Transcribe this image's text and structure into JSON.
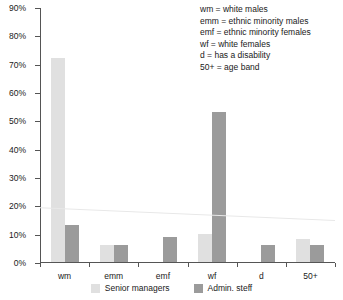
{
  "chart_data": {
    "type": "bar",
    "title": "",
    "xlabel": "",
    "ylabel": "",
    "ylim": [
      0,
      90
    ],
    "ytick_labels": [
      "0%",
      "10%",
      "20%",
      "30%",
      "40%",
      "50%",
      "60%",
      "70%",
      "80%",
      "90%"
    ],
    "ytick_values": [
      0,
      10,
      20,
      30,
      40,
      50,
      60,
      70,
      80,
      90
    ],
    "grid": false,
    "legend_position": "bottom",
    "categories": [
      "wm",
      "emm",
      "emf",
      "wf",
      "d",
      "50+"
    ],
    "series": [
      {
        "name": "Senior managers",
        "color": "#e0e0e0",
        "values": [
          72,
          6,
          null,
          10,
          null,
          8
        ]
      },
      {
        "name": "Admin. steff",
        "color": "#9b9b9b",
        "values": [
          13,
          6,
          9,
          53,
          6,
          6
        ]
      }
    ],
    "trendline": {
      "name": "trend",
      "color": "#e8e8e8",
      "start_value": 19.5,
      "end_value": 15.0
    },
    "annotations": [
      "wm = white males",
      "emm = ethnic minority males",
      "emf = ethnic minority females",
      "wf = white females",
      "d = has a disability",
      "50+ = age band"
    ]
  },
  "colors": {
    "series_light": "#e0e0e0",
    "series_dark": "#9b9b9b",
    "axis": "#555555",
    "text": "#1a1a1a",
    "trend": "#e8e8e8",
    "background": "#ffffff"
  }
}
